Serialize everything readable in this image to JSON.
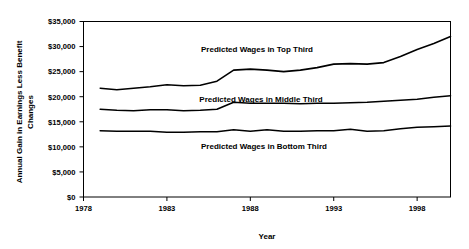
{
  "chart_data": {
    "type": "line",
    "title": "",
    "xlabel": "Year",
    "ylabel": "Annual Gain in Earnings Less Benefit Changes",
    "ylabel_line1": "Annual Gain in Earnings Less Benefit",
    "ylabel_line2": "Changes",
    "grid": false,
    "legend_position": "inline-annotations",
    "xlim": [
      1978,
      2000
    ],
    "ylim": [
      0,
      35000
    ],
    "x_ticks": [
      1978,
      1983,
      1988,
      1993,
      1998
    ],
    "x_tick_labels": [
      "1978",
      "1983",
      "1988",
      "1993",
      "1998"
    ],
    "y_ticks": [
      0,
      5000,
      10000,
      15000,
      20000,
      25000,
      30000,
      35000
    ],
    "y_tick_labels": [
      "$0",
      "$5,000",
      "$10,000",
      "$15,000",
      "$20,000",
      "$25,000",
      "$30,000",
      "$35,000"
    ],
    "x": [
      1979,
      1980,
      1981,
      1982,
      1983,
      1984,
      1985,
      1986,
      1987,
      1988,
      1989,
      1990,
      1991,
      1992,
      1993,
      1994,
      1995,
      1996,
      1997,
      1998,
      1999,
      2000
    ],
    "series": [
      {
        "name": "Predicted Wages in Top Third",
        "label": "Predicted Wages in Top Third",
        "color": "#000000",
        "values": [
          21700,
          21400,
          21700,
          22000,
          22400,
          22200,
          22300,
          23100,
          25300,
          25500,
          25300,
          25000,
          25300,
          25800,
          26500,
          26600,
          26500,
          26800,
          28000,
          29400,
          30600,
          32000
        ]
      },
      {
        "name": "Predicted Wages in Middle Third",
        "label": "Predicted Wages in Middle Third",
        "color": "#000000",
        "values": [
          17500,
          17300,
          17200,
          17400,
          17400,
          17200,
          17300,
          17500,
          18900,
          18700,
          18700,
          18700,
          18600,
          18700,
          18700,
          18800,
          18900,
          19100,
          19300,
          19500,
          19900,
          20200
        ]
      },
      {
        "name": "Predicted Wages in Bottom Third",
        "label": "Predicted Wages in Bottom Third",
        "color": "#000000",
        "values": [
          13200,
          13100,
          13100,
          13100,
          12900,
          12900,
          13000,
          13000,
          13400,
          13100,
          13400,
          13100,
          13100,
          13200,
          13200,
          13500,
          13100,
          13200,
          13600,
          13900,
          14000,
          14150
        ]
      }
    ],
    "annotations": [
      {
        "text": "Predicted Wages in Top Third",
        "x_px": 257,
        "y_px": 52
      },
      {
        "text": "Predicted Wages in Middle Third",
        "x_px": 261,
        "y_px": 102
      },
      {
        "text": "Predicted Wages in Bottom Third",
        "x_px": 264,
        "y_px": 149
      }
    ]
  }
}
